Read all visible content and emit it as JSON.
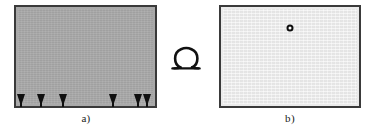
{
  "figure": {
    "canvas_width": 371,
    "canvas_height": 131,
    "background_color": "#ffffff",
    "transform_symbol": {
      "name": "omega-symbol",
      "glyph": "Ω",
      "color": "#111111"
    }
  },
  "panels": [
    {
      "id": "a",
      "caption": "a)",
      "fill_color": "#a9a9a9",
      "border_color": "#3a3a3a",
      "description": "dark gray region with arrow markers along bottom edge",
      "markers": {
        "type": "down-arrow",
        "color": "#101010",
        "count": 6,
        "x_positions": [
          21,
          41,
          63,
          113,
          138,
          147
        ]
      }
    },
    {
      "id": "b",
      "caption": "b)",
      "fill_color": "#ebebeb",
      "border_color": "#3a3a3a",
      "description": "light gray region with a single small ring marker",
      "markers": {
        "type": "circle",
        "color": "#0d0d0d",
        "count": 1,
        "points": [
          {
            "x": 290,
            "y": 28
          }
        ]
      }
    }
  ]
}
